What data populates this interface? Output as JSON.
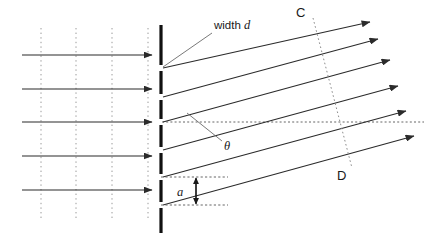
{
  "figure": {
    "background_color": "#ffffff",
    "width": 424,
    "height": 244
  },
  "labels": {
    "width_d": "width d",
    "theta": "θ",
    "slit_a": "a",
    "point_c": "C",
    "point_d": "D"
  },
  "colors": {
    "ray_stroke": "#2b2b2b",
    "barrier_stroke": "#111111",
    "wavefront_dotted": "#9a9a9a",
    "guide_dashed": "#555555",
    "cd_dotted": "#8c8c8c",
    "text": "#1a1a1a"
  },
  "incoming_rays": {
    "count": 5,
    "x_start": 22,
    "x_end": 152,
    "y_positions": [
      55,
      89,
      122,
      156,
      190
    ],
    "direction": "left-to-right-horizontal"
  },
  "incoming_wavefronts": {
    "count": 4,
    "x_positions": [
      41,
      76,
      112,
      148
    ],
    "y_top": 28,
    "y_bottom": 218,
    "style": "vertical-dotted"
  },
  "barrier": {
    "x": 161,
    "y_top": 25,
    "y_bottom": 233,
    "stroke_width": 3.2,
    "slit_centers": [
      68,
      97,
      122,
      150,
      177,
      205
    ],
    "slit_gap": 5
  },
  "diffracted_rays": {
    "count": 6,
    "angle_label": "θ",
    "origins_y": [
      68,
      97,
      122,
      150,
      177,
      205
    ],
    "x_start": 163,
    "x_ends": [
      370,
      378,
      390,
      398,
      406,
      414
    ],
    "rise_per_ray": -46,
    "direction": "up-and-to-the-right"
  },
  "cd_line": {
    "label_top": "C",
    "label_bottom": "D",
    "x_top": 313,
    "y_top": 20,
    "x_bottom": 350,
    "y_bottom": 165,
    "style": "dotted"
  },
  "reference_line": {
    "description": "horizontal dotted reference from central slit",
    "x_start": 162,
    "x_end": 424,
    "y": 122
  },
  "slit_spacing_marker": {
    "label": "a",
    "arrow_x": 196,
    "y_top": 177,
    "y_bottom": 205,
    "guide_x_start": 161,
    "guide_x_end": 225,
    "style": "double-headed-vertical-arrow"
  },
  "width_d_leader": {
    "label": "width d",
    "text_x": 214,
    "text_y": 28,
    "line_from": [
      212,
      33
    ],
    "line_to": [
      163,
      67
    ]
  },
  "theta_leader": {
    "label": "θ",
    "text_x": 224,
    "text_y": 149,
    "line_from": [
      222,
      142
    ],
    "line_to": [
      188,
      113
    ]
  }
}
